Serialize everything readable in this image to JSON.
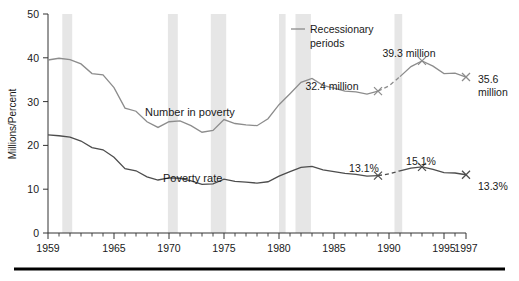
{
  "chart_data": {
    "type": "line",
    "title": "",
    "xlabel": "",
    "ylabel": "Millions/Percent",
    "xlim": [
      1959,
      1997
    ],
    "ylim": [
      0,
      50
    ],
    "ytick_labels": [
      "0",
      "10",
      "20",
      "30",
      "40",
      "50"
    ],
    "ytick_values": [
      0,
      10,
      20,
      30,
      40,
      50
    ],
    "xtick_labels": [
      "1959",
      "1965",
      "1970",
      "1975",
      "1980",
      "1985",
      "1990",
      "1995",
      "1997"
    ],
    "xtick_values": [
      1959,
      1965,
      1970,
      1975,
      1980,
      1985,
      1990,
      1995,
      1997
    ],
    "minor_xticks": "every year 1959-1997",
    "grid": false,
    "legend_position": "upper-right-inside",
    "x": [
      1959,
      1960,
      1961,
      1962,
      1963,
      1964,
      1965,
      1966,
      1967,
      1968,
      1969,
      1970,
      1971,
      1972,
      1973,
      1974,
      1975,
      1976,
      1977,
      1978,
      1979,
      1980,
      1981,
      1982,
      1983,
      1984,
      1985,
      1986,
      1987,
      1988,
      1989,
      1990,
      1991,
      1992,
      1993,
      1994,
      1995,
      1996,
      1997
    ],
    "series": [
      {
        "name": "Number in poverty",
        "units": "millions",
        "color": "#8c8c8c",
        "values": [
          39.5,
          39.9,
          39.6,
          38.6,
          36.4,
          36.1,
          33.2,
          28.5,
          27.8,
          25.4,
          24.1,
          25.4,
          25.6,
          24.5,
          23.0,
          23.4,
          25.9,
          25.0,
          24.7,
          24.5,
          26.1,
          29.3,
          31.8,
          34.4,
          35.3,
          33.7,
          33.1,
          32.4,
          32.2,
          31.7,
          32.4,
          33.6,
          35.7,
          38.0,
          39.3,
          38.1,
          36.4,
          36.5,
          35.6
        ]
      },
      {
        "name": "Poverty rate",
        "units": "percent",
        "color": "#4d4d4d",
        "values": [
          22.4,
          22.2,
          21.9,
          21.0,
          19.5,
          19.0,
          17.3,
          14.7,
          14.2,
          12.8,
          12.1,
          12.6,
          12.5,
          11.9,
          11.1,
          11.2,
          12.3,
          11.8,
          11.6,
          11.4,
          11.7,
          13.0,
          14.0,
          15.0,
          15.2,
          14.4,
          14.0,
          13.6,
          13.4,
          13.0,
          13.1,
          13.5,
          14.2,
          14.8,
          15.1,
          14.5,
          13.8,
          13.7,
          13.3
        ]
      }
    ],
    "markers": [
      {
        "series": "Number in poverty",
        "x": 1989,
        "y": 32.4,
        "label": "32.4 million"
      },
      {
        "series": "Number in poverty",
        "x": 1993,
        "y": 39.3,
        "label": "39.3 million"
      },
      {
        "series": "Number in poverty",
        "x": 1997,
        "y": 35.6,
        "label": "35.6 million"
      },
      {
        "series": "Poverty rate",
        "x": 1989,
        "y": 13.1,
        "label": "13.1%"
      },
      {
        "series": "Poverty rate",
        "x": 1993,
        "y": 15.1,
        "label": "15.1%"
      },
      {
        "series": "Poverty rate",
        "x": 1997,
        "y": 13.3,
        "label": "13.3%"
      }
    ],
    "dashed_break_segments": [
      {
        "series": "Number in poverty",
        "from_x": 1989,
        "to_x": 1991
      },
      {
        "series": "Poverty rate",
        "from_x": 1989,
        "to_x": 1991
      }
    ],
    "recession_bands": [
      {
        "start": 1960.3,
        "end": 1961.2
      },
      {
        "start": 1969.9,
        "end": 1970.8
      },
      {
        "start": 1973.8,
        "end": 1975.2
      },
      {
        "start": 1980.0,
        "end": 1980.6
      },
      {
        "start": 1981.5,
        "end": 1982.9
      },
      {
        "start": 1990.5,
        "end": 1991.2
      }
    ],
    "annotations": {
      "legend_text_line1": "Recessionary",
      "legend_text_line2": "periods",
      "label_number": "Number in poverty",
      "label_rate": "Poverty rate",
      "marker_32_4": "32.4 million",
      "marker_39_3": "39.3 million",
      "marker_35_6_line1": "35.6",
      "marker_35_6_line2": "million",
      "marker_13_1": "13.1%",
      "marker_15_1": "15.1%",
      "marker_13_3": "13.3%"
    },
    "colors": {
      "number_series": "#8c8c8c",
      "rate_series": "#4d4d4d",
      "recession_band": "#e6e6e6",
      "axis": "#333333",
      "bottom_rule": "#000000",
      "background": "#ffffff"
    }
  }
}
